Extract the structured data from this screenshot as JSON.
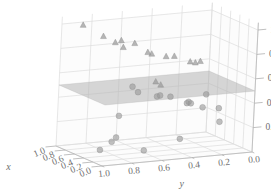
{
  "chart_data": {
    "type": "scatter",
    "projection": "3d",
    "title": "",
    "xlabel": "x",
    "ylabel": "y",
    "zlabel": "z",
    "xlim": [
      0.0,
      1.0
    ],
    "ylim": [
      0.0,
      1.0
    ],
    "zlim": [
      0.0,
      1.0
    ],
    "xticks": [
      "1.0",
      "0.8",
      "0.6",
      "0.4",
      "0.2",
      "0.0"
    ],
    "yticks": [
      "1.0",
      "0.8",
      "0.6",
      "0.4",
      "0.2",
      "0.0"
    ],
    "zticks": [
      "0.2",
      "0.4",
      "0.6",
      "0.8",
      "1.0"
    ],
    "xtick_values": [
      1.0,
      0.8,
      0.6,
      0.4,
      0.2,
      0.0
    ],
    "ytick_values": [
      1.0,
      0.8,
      0.6,
      0.4,
      0.2,
      0.0
    ],
    "ztick_values": [
      0.2,
      0.4,
      0.6,
      0.8,
      1.0
    ],
    "grid": true,
    "legend": "none",
    "marker_color": "#9a9a9a",
    "plane_color": "#b4b4b4",
    "grid_color": "#d8d8d8",
    "pane_color": "#fcfcfc",
    "series": [
      {
        "name": "above-plane",
        "marker": "triangle",
        "color": "#9a9a9a",
        "points": [
          {
            "x": 0.93,
            "y": 0.88,
            "z": 0.99
          },
          {
            "x": 0.74,
            "y": 0.8,
            "z": 0.92
          },
          {
            "x": 0.8,
            "y": 0.66,
            "z": 0.86
          },
          {
            "x": 0.56,
            "y": 0.72,
            "z": 0.85
          },
          {
            "x": 0.29,
            "y": 0.86,
            "z": 0.95
          },
          {
            "x": 0.13,
            "y": 0.78,
            "z": 0.96
          },
          {
            "x": 0.33,
            "y": 0.6,
            "z": 0.82
          },
          {
            "x": 0.86,
            "y": 0.46,
            "z": 0.73
          },
          {
            "x": 0.72,
            "y": 0.38,
            "z": 0.71
          },
          {
            "x": 0.45,
            "y": 0.41,
            "z": 0.76
          },
          {
            "x": 0.36,
            "y": 0.33,
            "z": 0.72
          },
          {
            "x": 0.24,
            "y": 0.3,
            "z": 0.74
          },
          {
            "x": 0.6,
            "y": 0.22,
            "z": 0.66
          },
          {
            "x": 0.47,
            "y": 0.52,
            "z": 0.56
          },
          {
            "x": 0.52,
            "y": 0.47,
            "z": 0.52
          }
        ]
      },
      {
        "name": "below-plane",
        "marker": "circle",
        "color": "#9a9a9a",
        "points": [
          {
            "x": 0.8,
            "y": 0.57,
            "z": 0.47
          },
          {
            "x": 0.55,
            "y": 0.61,
            "z": 0.47
          },
          {
            "x": 0.3,
            "y": 0.56,
            "z": 0.47
          },
          {
            "x": 0.68,
            "y": 0.42,
            "z": 0.4
          },
          {
            "x": 0.84,
            "y": 0.3,
            "z": 0.35
          },
          {
            "x": 0.61,
            "y": 0.26,
            "z": 0.33
          },
          {
            "x": 0.86,
            "y": 0.17,
            "z": 0.29
          },
          {
            "x": 0.78,
            "y": 0.1,
            "z": 0.25
          },
          {
            "x": 0.4,
            "y": 0.2,
            "z": 0.43
          },
          {
            "x": 0.24,
            "y": 0.35,
            "z": 0.4
          },
          {
            "x": 0.18,
            "y": 0.18,
            "z": 0.35
          },
          {
            "x": 0.47,
            "y": 0.08,
            "z": 0.18
          },
          {
            "x": 0.12,
            "y": 0.45,
            "z": 0.14
          },
          {
            "x": 0.62,
            "y": 0.72,
            "z": 0.1
          },
          {
            "x": 0.36,
            "y": 0.83,
            "z": 0.12
          },
          {
            "x": 0.08,
            "y": 0.7,
            "z": 0.08
          },
          {
            "x": 0.22,
            "y": 0.95,
            "z": 0.09
          },
          {
            "x": 0.9,
            "y": 0.62,
            "z": 0.22
          }
        ]
      }
    ],
    "surface": {
      "name": "decision-plane",
      "type": "plane",
      "z": 0.5,
      "color": "#b4b4b4",
      "opacity": 0.55
    }
  },
  "axes": {
    "x": {
      "label": "x",
      "ticks": [
        "1.0",
        "0.8",
        "0.6",
        "0.4",
        "0.2",
        "0.0"
      ]
    },
    "y": {
      "label": "y",
      "ticks": [
        "1.0",
        "0.8",
        "0.6",
        "0.4",
        "0.2",
        "0.0"
      ]
    },
    "z": {
      "label": "z",
      "ticks": [
        "0.2",
        "0.4",
        "0.6",
        "0.8",
        "1.0"
      ]
    }
  }
}
